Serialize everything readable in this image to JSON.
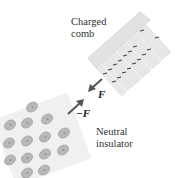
{
  "figure": {
    "comb_label": [
      "Charged",
      "comb"
    ],
    "insulator_label": [
      "Neutral",
      "insulator"
    ],
    "force_on_comb": "F",
    "force_on_insulator": "−F",
    "molecule_symbols": {
      "positive": "+",
      "negative": "−"
    },
    "colors": {
      "comb_body": "#e2e2e2",
      "comb_edge": "#cfcfcf",
      "charge_mark": "#444444",
      "insulator_fill": "#f0f0f0",
      "molecule_fill": "#b8b8b8",
      "arrow": "#555555",
      "text": "#333333"
    }
  }
}
